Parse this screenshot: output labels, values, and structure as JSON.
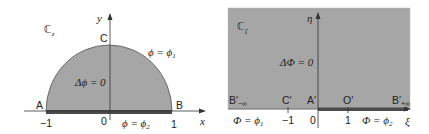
{
  "colors": {
    "fill": "#a6a6a6",
    "boundary_dark": "#4a4a4a",
    "axis": "#333333",
    "text": "#222222",
    "background": "#ffffff"
  },
  "left_panel": {
    "plane_label": "ℂ",
    "plane_sub": "z",
    "x_axis_label": "x",
    "y_axis_label": "y",
    "points": {
      "A": "A",
      "B": "B",
      "C": "C"
    },
    "ticks": {
      "neg1": "−1",
      "zero": "0",
      "one": "1"
    },
    "arc_condition": {
      "lhs": "ϕ = ϕ",
      "sub": "1"
    },
    "base_condition": {
      "lhs": "ϕ = ϕ",
      "sub": "2"
    },
    "equation": "Δϕ = 0"
  },
  "right_panel": {
    "plane_label": "ℂ",
    "plane_sub": "ζ",
    "x_axis_label": "ξ",
    "y_axis_label": "η",
    "points": {
      "B_left": "B′",
      "B_left_sub": "−∞",
      "C": "C′",
      "A": "A′",
      "O": "O′",
      "B_right": "B′",
      "B_right_sub": "+∞"
    },
    "ticks": {
      "neg1": "−1",
      "zero": "0",
      "one": "1"
    },
    "left_condition": {
      "lhs": "Φ = ϕ",
      "sub": "1"
    },
    "right_condition": {
      "lhs": "Φ = ϕ",
      "sub": "2"
    },
    "equation": "ΔΦ = 0"
  }
}
